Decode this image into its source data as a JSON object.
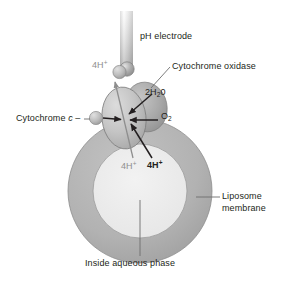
{
  "figure": {
    "width": 291,
    "height": 281,
    "background": "#ffffff"
  },
  "labels": {
    "ph_electrode": "pH electrode",
    "cytochrome_oxidase": "Cytochrome oxidase",
    "water_product_prefix": "2H",
    "water_product_sub": "2",
    "water_product_suffix": "0",
    "oxygen_prefix": "O",
    "oxygen_sub": "2",
    "cytochrome_c_text": "Cytochrome ",
    "cytochrome_c_italic": "c",
    "cytochrome_c_dash": " –",
    "protons_out": "4H",
    "protons_out_charge": "+",
    "protons_pumped": "4H",
    "protons_pumped_charge": "+",
    "protons_consumed": "4H",
    "protons_consumed_charge": "+",
    "liposome_membrane_line1": "Liposome",
    "liposome_membrane_line2": "membrane",
    "inside_aqueous_phase": "Inside aqueous phase"
  },
  "colors": {
    "text": "#231f20",
    "text_gray": "#8e8e8e",
    "membrane_ring": "#b3b3b3",
    "membrane_ring_stroke": "#8a8a8a",
    "inner_aqueous": "#ececec",
    "protein_front": "#c9c9c9",
    "protein_back": "#a9a9a9",
    "protein_stroke": "#7d7d7d",
    "electrode_shaft_top": "#fcfcfc",
    "electrode_shaft_bottom": "#9e9e9e",
    "electrode_bulb": "#a3a3a3",
    "cyt_c_sphere": "#bdbdbd",
    "proton_sphere": "#9c9c9c",
    "arrow_dark": "#231f20",
    "leader_line": "#6e6e6e",
    "proton_arrow_gray": "#909090"
  },
  "elements": {
    "electrode_shaft": {
      "x": 120,
      "y": 11,
      "width": 13,
      "height": 54
    },
    "electrode_bulb": {
      "cx": 127,
      "cy": 69,
      "r": 7
    },
    "liposome_outer": {
      "cx": 140,
      "cy": 191,
      "r": 72
    },
    "liposome_inner": {
      "cx": 140,
      "cy": 191,
      "r": 47
    },
    "protein_front_ellipse": {
      "cx": 124,
      "cy": 118,
      "rx": 22,
      "ry": 31
    },
    "protein_back_ellipse": {
      "cx": 145,
      "cy": 108,
      "rx": 20,
      "ry": 25
    },
    "cyt_c_sphere": {
      "cx": 96,
      "cy": 118,
      "r": 6.5
    },
    "proton_sphere": {
      "cx": 119,
      "cy": 72,
      "r": 6.5
    },
    "reaction_center": {
      "x": 125,
      "y": 120
    }
  },
  "icon_names": [
    "ph-electrode-icon",
    "liposome-ring-icon",
    "cytochrome-oxidase-blob-icon",
    "cytochrome-c-sphere-icon",
    "proton-sphere-icon",
    "arrow-icon",
    "leader-line-icon"
  ]
}
